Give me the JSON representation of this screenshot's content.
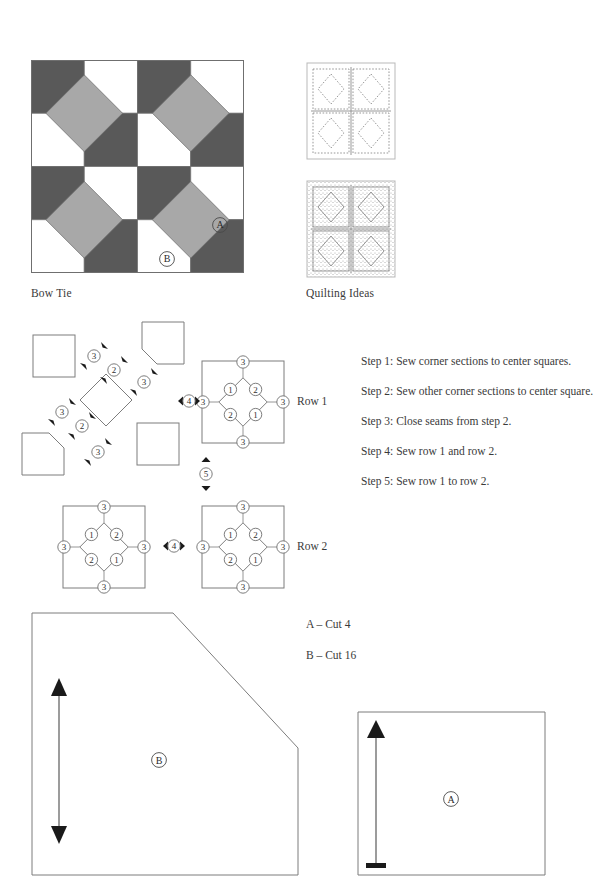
{
  "blocks": {
    "bow_tie": {
      "caption": "Bow Tie",
      "label_a": "A",
      "label_b": "B",
      "colors": {
        "dark": "#595959",
        "medium": "#a8a8a8",
        "light": "#ffffff",
        "outline": "#6f6f6f"
      },
      "grid": [
        [
          "dark",
          "light",
          "dark",
          "light"
        ],
        [
          "light",
          "dark",
          "light",
          "dark"
        ],
        [
          "dark",
          "light",
          "dark",
          "light"
        ],
        [
          "light",
          "dark",
          "light",
          "dark"
        ]
      ],
      "bowtie_centers": [
        {
          "cell_x": 1,
          "cell_y": 1
        },
        {
          "cell_x": 3,
          "cell_y": 1
        },
        {
          "cell_x": 1,
          "cell_y": 3
        },
        {
          "cell_x": 3,
          "cell_y": 3
        }
      ]
    },
    "quilting": {
      "caption": "Quilting Ideas",
      "idea_1_style": "dotted-stitch-outline",
      "idea_2_style": "stippled-fill",
      "grid_size": 2
    }
  },
  "assembly": {
    "row_1_label": "Row 1",
    "row_2_label": "Row 2",
    "join_marker": "4",
    "row_join_marker": "5",
    "exploded": {
      "markers": [
        "3",
        "2",
        "3",
        "3",
        "2",
        "3"
      ]
    },
    "block_numbers": {
      "north": "3",
      "east": "3",
      "south": "3",
      "west": "3",
      "inner_top_left": "1",
      "inner_top_right": "2",
      "inner_bottom_left": "2",
      "inner_bottom_right": "1"
    }
  },
  "steps": [
    "Step 1: Sew corner sections to center squares.",
    "Step 2: Sew other corner sections to center square.",
    "Step 3: Close seams from step 2.",
    "Step 4: Sew row 1 and row 2.",
    "Step 5: Sew row 1 to row 2."
  ],
  "cutting": [
    "A – Cut 4",
    "B – Cut 16"
  ],
  "pattern_pieces": {
    "piece_b": {
      "label": "B",
      "grain_arrow": "double-headed-vertical"
    },
    "piece_a": {
      "label": "A",
      "grain_arrow": "single-headed-up"
    }
  }
}
